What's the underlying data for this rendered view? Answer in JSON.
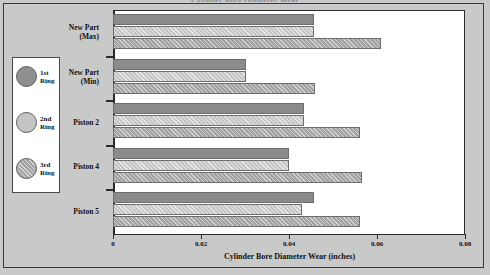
{
  "chart_data": {
    "type": "bar",
    "orientation": "horizontal",
    "title": "Cylinder Bore Diameter Wear",
    "xlabel": "Cylinder Bore Diameter Wear (inches)",
    "ylabel": "",
    "xlim": [
      0,
      0.08
    ],
    "xticks": [
      "0",
      "0.02",
      "0.04",
      "0.06",
      "0.08"
    ],
    "xtick_values": [
      0,
      0.02,
      0.04,
      0.06,
      0.08
    ],
    "grid": false,
    "legend_position": "left-outside",
    "categories": [
      "New Part\n(Max)",
      "New Part\n(Min)",
      "Piston 2",
      "Piston 4",
      "Piston 5"
    ],
    "series": [
      {
        "name": "1st\nRing",
        "legend_label": "1st Ring",
        "color": "#8b8b8b",
        "values": [
          0.0456,
          0.0303,
          0.0433,
          0.0401,
          0.0456
        ]
      },
      {
        "name": "2nd\nRing",
        "legend_label": "2nd Ring",
        "color": "#c6c6c6",
        "values": [
          0.0456,
          0.0303,
          0.0433,
          0.0401,
          0.0429
        ]
      },
      {
        "name": "3rd\nRing",
        "legend_label": "3rd Ring",
        "color": "#a3a3a3",
        "values": [
          0.0608,
          0.0458,
          0.0562,
          0.0566,
          0.0562
        ]
      }
    ]
  },
  "legend": {
    "items": [
      {
        "label": "1st\nRing",
        "swatch": "circle-dark-gray"
      },
      {
        "label": "2nd\nRing",
        "swatch": "circle-light-gray"
      },
      {
        "label": "3rd\nRing",
        "swatch": "circle-hatched-gray"
      }
    ]
  },
  "axes": {
    "x_title": "Cylinder Bore Diameter Wear (inches)",
    "x_labels": [
      "0",
      "0.02",
      "0.04",
      "0.06",
      "0.08"
    ],
    "y_labels": [
      "New Part\n(Max)",
      "New Part\n(Min)",
      "Piston 2",
      "Piston 4",
      "Piston 5"
    ]
  },
  "figure": {
    "title_cropped": "Cylinder Bore Diameter Wear"
  }
}
